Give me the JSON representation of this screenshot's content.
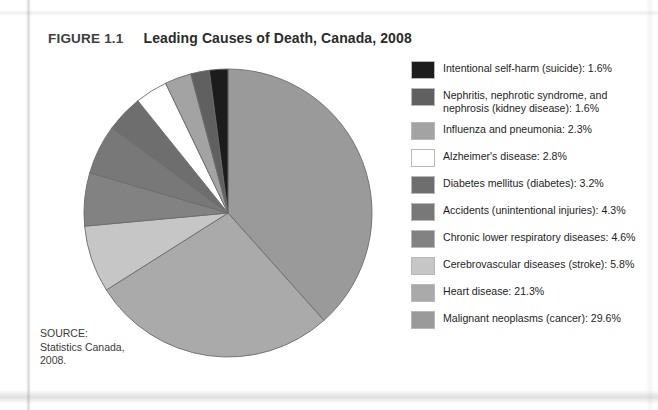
{
  "figure": {
    "label": "FIGURE 1.1",
    "title": "Leading Causes of Death, Canada, 2008"
  },
  "source": {
    "text": "SOURCE:\nStatistics Canada,\n2008."
  },
  "legend": {
    "items": [
      {
        "label": "Intentional self-harm (suicide): 1.6%",
        "color": "#1c1c1c"
      },
      {
        "label": "Nephritis, nephrotic syndrome, and\nnephrosis (kidney disease): 1.6%",
        "color": "#606060"
      },
      {
        "label": "Influenza and pneumonia: 2.3%",
        "color": "#a3a3a3"
      },
      {
        "label": "Alzheimer's disease: 2.8%",
        "color": "#ffffff"
      },
      {
        "label": "Diabetes mellitus (diabetes): 3.2%",
        "color": "#6e6e6e"
      },
      {
        "label": "Accidents (unintentional injuries): 4.3%",
        "color": "#787878"
      },
      {
        "label": "Chronic lower respiratory diseases: 4.6%",
        "color": "#828282"
      },
      {
        "label": "Cerebrovascular diseases (stroke): 5.8%",
        "color": "#c6c6c6"
      },
      {
        "label": "Heart disease: 21.3%",
        "color": "#aaaaaa"
      },
      {
        "label": "Malignant neoplasms (cancer): 29.6%",
        "color": "#9a9a9a"
      }
    ]
  },
  "chart_data": {
    "type": "pie",
    "title": "Leading Causes of Death, Canada, 2008",
    "unit": "percent of deaths",
    "start_angle_deg": -90,
    "direction": "clockwise",
    "legend_position": "right",
    "grid": false,
    "total_labeled_percent": 77.1,
    "labels": [
      "Malignant neoplasms (cancer)",
      "Heart disease",
      "Cerebrovascular diseases (stroke)",
      "Chronic lower respiratory diseases",
      "Accidents (unintentional injuries)",
      "Diabetes mellitus (diabetes)",
      "Alzheimer's disease",
      "Influenza and pneumonia",
      "Nephritis, nephrotic syndrome, and nephrosis (kidney disease)",
      "Intentional self-harm (suicide)"
    ],
    "values": [
      29.6,
      21.3,
      5.8,
      4.6,
      4.3,
      3.2,
      2.8,
      2.3,
      1.6,
      1.6
    ],
    "colors": [
      "#9a9a9a",
      "#aaaaaa",
      "#c6c6c6",
      "#828282",
      "#787878",
      "#6e6e6e",
      "#ffffff",
      "#a3a3a3",
      "#606060",
      "#1c1c1c"
    ],
    "slice_stroke": "#6b6b6b"
  }
}
